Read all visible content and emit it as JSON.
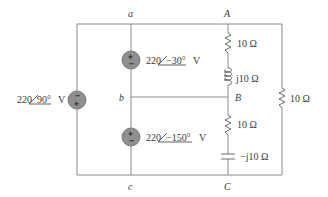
{
  "diagram": {
    "type": "ac-circuit",
    "nodes": {
      "a": "a",
      "b": "b",
      "c": "c",
      "A": "A",
      "B": "B",
      "C": "C"
    },
    "sources": [
      {
        "id": "left",
        "magnitude": "220",
        "angle": "90°",
        "unit": "V",
        "polarity_top": "−",
        "polarity_bottom": "+"
      },
      {
        "id": "upper-middle",
        "magnitude": "220",
        "angle": "−30°",
        "unit": "V",
        "polarity_top": "+",
        "polarity_bottom": "−"
      },
      {
        "id": "lower-middle",
        "magnitude": "220",
        "angle": "−150°",
        "unit": "V",
        "polarity_top": "+",
        "polarity_bottom": "−"
      }
    ],
    "impedances": [
      {
        "id": "resistor-AB",
        "label": "10 Ω",
        "type": "resistor"
      },
      {
        "id": "inductor-AB",
        "label": "j10 Ω",
        "type": "inductor"
      },
      {
        "id": "resistor-BC",
        "label": "10 Ω",
        "type": "resistor"
      },
      {
        "id": "capacitor-BC",
        "label": "−j10 Ω",
        "type": "capacitor"
      },
      {
        "id": "resistor-AC",
        "label": "10 Ω",
        "type": "resistor"
      }
    ]
  }
}
